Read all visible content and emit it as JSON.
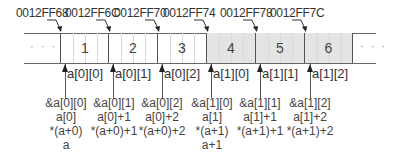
{
  "diagram": {
    "addresses": [
      "0012FF68",
      "0012FF6C",
      "0012FF70",
      "0012FF74",
      "0012FF78",
      "0012FF7C"
    ],
    "ellipsis_left": "· · ·",
    "ellipsis_right": "· · ·",
    "cells": [
      {
        "value": "1",
        "shaded": false
      },
      {
        "value": "2",
        "shaded": false
      },
      {
        "value": "3",
        "shaded": false
      },
      {
        "value": "4",
        "shaded": true
      },
      {
        "value": "5",
        "shaded": true
      },
      {
        "value": "6",
        "shaded": true
      }
    ],
    "element_labels": [
      "a[0][0]",
      "a[0][1]",
      "a[0][2]",
      "a[1][0]",
      "a[1][1]",
      "a[1][2]"
    ],
    "expressions": [
      [
        "&a[0][0]",
        "a[0]",
        "*(a+0)",
        "a"
      ],
      [
        "&a[0][1]",
        "a[0]+1",
        "*(a+0)+1"
      ],
      [
        "&a[0][2]",
        "a[0]+2",
        "*(a+0)+2"
      ],
      [
        "&a[1][0]",
        "a[1]",
        "*(a+1)",
        "a+1"
      ],
      [
        "&a[1][1]",
        "a[1]+1",
        "*(a+1)+1"
      ],
      [
        "&a[1][2]",
        "a[1]+2",
        "*(a+1)+2"
      ]
    ],
    "colors": {
      "shaded_cell": "#e4e4e4",
      "line": "#555555",
      "text": "#333333"
    }
  }
}
